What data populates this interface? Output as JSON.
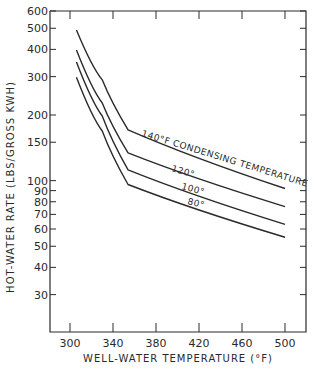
{
  "chart_data": {
    "type": "line",
    "title": "",
    "xlabel": "WELL-WATER TEMPERATURE (°F)",
    "ylabel": "HOT-WATER RATE (LBS/GROSS KWH)",
    "xlim": [
      280,
      520
    ],
    "ylim": [
      20,
      600
    ],
    "yscale": "log",
    "grid": false,
    "legend": "inline curve labels",
    "x_ticks": [
      300,
      340,
      380,
      420,
      460,
      500
    ],
    "y_ticks": [
      30,
      40,
      50,
      60,
      70,
      80,
      90,
      100,
      150,
      200,
      300,
      400,
      500,
      600
    ],
    "x": [
      306,
      330,
      354,
      500
    ],
    "series": [
      {
        "name": "140°F CONDENSING TEMPERATURE",
        "label": "140°F CONDENSING TEMPERATURE",
        "values": [
          491,
          290,
          171,
          92
        ]
      },
      {
        "name": "120°",
        "label": "120°",
        "values": [
          397,
          227,
          134,
          76
        ]
      },
      {
        "name": "100°",
        "label": "100°",
        "values": [
          350,
          198,
          112,
          63
        ]
      },
      {
        "name": "80°",
        "label": "80°",
        "values": [
          298,
          169,
          96,
          55
        ]
      }
    ]
  },
  "colors": {
    "line": "#2a2a2a",
    "background": "#ffffff"
  }
}
